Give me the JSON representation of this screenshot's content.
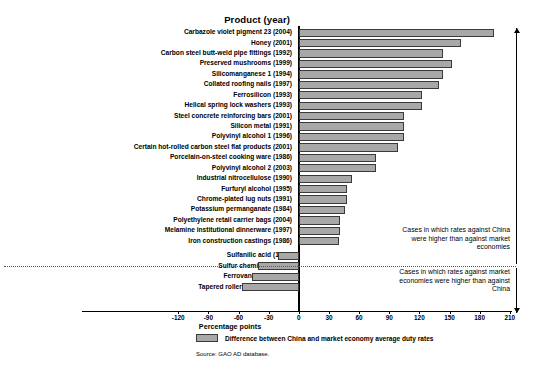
{
  "header": {
    "product_column": "Product (year)"
  },
  "legend": {
    "label": "Difference between China and market economy average duty rates"
  },
  "source": {
    "text": "Source: GAO AD database."
  },
  "annotations": {
    "upper": "Cases in which rates against China were higher than against market economies",
    "lower": "Cases in which rates against market economies were higher than against China"
  },
  "chart_data": {
    "type": "bar",
    "orientation": "horizontal",
    "title": "",
    "xlabel": "Percentage points",
    "ylabel": "Product (year)",
    "xlim": [
      -120,
      210
    ],
    "xticks": [
      -120,
      -90,
      -60,
      -30,
      0,
      30,
      60,
      90,
      120,
      150,
      180,
      210
    ],
    "xticklabels": [
      "-120",
      "-90",
      "-60",
      "-30",
      "0",
      "30",
      "60",
      "90",
      "120",
      "150",
      "180",
      "210"
    ],
    "grid": false,
    "legend_position": "below-axis-left",
    "series_name": "Difference between China and market economy average duty rates",
    "bar_color": "#a8a8a8",
    "bar_edge_color": "#3a3a3a",
    "categories": [
      "Carbazole violet pigment 23 (2004)",
      "Honey (2001)",
      "Carbon steel butt-weld pipe fittings (1992)",
      "Preserved mushrooms (1999)",
      "Silicomanganese 1 (1994)",
      "Collated roofing nails (1997)",
      "Ferrosilicon (1993)",
      "Helical spring lock washers (1993)",
      "Steel concrete reinforcing bars (2001)",
      "Silicon metal (1991)",
      "Polyvinyl alcohol 1 (1996)",
      "Certain hot-rolled carbon steel flat products (2001)",
      "Porcelain-on-steel cooking ware (1986)",
      "Polyvinyl alcohol 2 (2003)",
      "Industrial nitrocellulose (1990)",
      "Furfuryl alcohol (1995)",
      "Chrome-plated lug nuts (1991)",
      "Potassium permanganate (1984)",
      "Polyethylene retail carrier bags (2004)",
      "Melamine institutional dinnerware (1997)",
      "Iron construction castings (1986)",
      "Sulfanilic acid (1992)",
      "Sulfur chemicals (1991)",
      "Ferrovanadium (2003)",
      "Tapered roller bearings (1987)"
    ],
    "values": [
      194,
      161,
      144,
      152,
      144,
      140,
      123,
      123,
      105,
      105,
      105,
      99,
      77,
      77,
      53,
      48,
      48,
      46,
      41,
      41,
      40,
      -21,
      -41,
      -47,
      -57
    ]
  }
}
